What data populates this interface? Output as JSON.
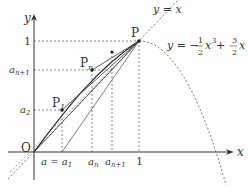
{
  "diagram": {
    "axes": {
      "x_label": "x",
      "y_label": "y",
      "origin_label": "O"
    },
    "ticks": {
      "y_one": "1",
      "y_an1": "a",
      "y_an1_sub": "n+1",
      "y_a2": "a",
      "y_a2_sub": "2",
      "x_a1": "a = a",
      "x_a1_sub": "1",
      "x_an": "a",
      "x_an_sub": "n",
      "x_an1": "a",
      "x_an1_sub": "n+1",
      "x_one": "1"
    },
    "points": {
      "P": "P",
      "P1": "P",
      "P1_sub": "1",
      "Pn": "P",
      "Pn_sub": "n"
    },
    "line_label": "y = x",
    "curve_label": {
      "lhs": "y = −",
      "frac1_num": "1",
      "frac1_den": "2",
      "mid": "x",
      "exp": "3",
      "plus": " + ",
      "frac2_num": "3",
      "frac2_den": "2",
      "end": "x"
    },
    "colors": {
      "ink": "#333333",
      "dash": "#555555"
    }
  }
}
